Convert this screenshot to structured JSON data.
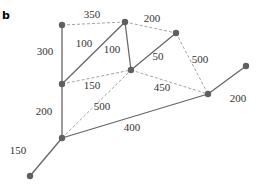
{
  "panel_label": "b",
  "graph": {
    "nodes": [
      "A",
      "B",
      "C",
      "D",
      "E",
      "F",
      "G",
      "H",
      "I"
    ],
    "edges": [
      {
        "from": "A",
        "to": "B",
        "weight": "350",
        "style": "dashed"
      },
      {
        "from": "B",
        "to": "C",
        "weight": "200",
        "style": "dashed"
      },
      {
        "from": "A",
        "to": "D",
        "weight": "300",
        "style": "solid"
      },
      {
        "from": "D",
        "to": "B",
        "weight": "100",
        "style": "solid"
      },
      {
        "from": "B",
        "to": "E",
        "weight": "100",
        "style": "solid"
      },
      {
        "from": "E",
        "to": "C",
        "weight": "50",
        "style": "solid"
      },
      {
        "from": "C",
        "to": "F",
        "weight": "500",
        "style": "dashed"
      },
      {
        "from": "D",
        "to": "E",
        "weight": "150",
        "style": "dashed"
      },
      {
        "from": "E",
        "to": "F",
        "weight": "450",
        "style": "dashed"
      },
      {
        "from": "H",
        "to": "E",
        "weight": "500",
        "style": "dashed"
      },
      {
        "from": "D",
        "to": "H",
        "weight": "200",
        "style": "solid"
      },
      {
        "from": "H",
        "to": "F",
        "weight": "400",
        "style": "solid"
      },
      {
        "from": "F",
        "to": "G",
        "weight": "200",
        "style": "solid"
      },
      {
        "from": "H",
        "to": "I",
        "weight": "150",
        "style": "solid"
      }
    ]
  }
}
